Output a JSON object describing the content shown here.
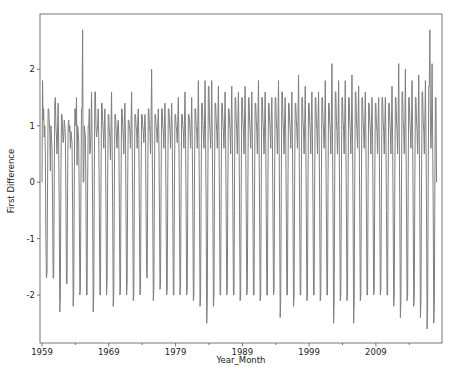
{
  "chart_data": {
    "type": "line",
    "title": "",
    "xlabel": "Year_Month",
    "ylabel": "First Difference",
    "x_tick_labels": [
      "1959",
      "1969",
      "1979",
      "1989",
      "1999",
      "2009"
    ],
    "y_tick_labels": [
      "-2",
      "-1",
      "0",
      "1",
      "2"
    ],
    "y_ticks": [
      -2,
      -1,
      0,
      1,
      2
    ],
    "xlim": [
      1958.7,
      2018.9
    ],
    "ylim": [
      -2.85,
      2.98
    ],
    "grid": false,
    "legend": null,
    "line_color": "#7f7f7f",
    "series": [
      {
        "name": "First Difference",
        "frequency": "monthly",
        "start": "1959-02",
        "years": [
          {
            "year": 1959,
            "values": [
              0.0,
              1.8,
              1.1,
              1.3,
              0.8,
              1.0,
              0.5,
              -1.0,
              -1.7,
              -1.6,
              0.0,
              1.3
            ]
          },
          {
            "year": 1960,
            "values": [
              1.3,
              1.1,
              0.9,
              0.2,
              1.0,
              0.8,
              0.6,
              -0.4,
              -1.7,
              -1.7,
              0.1,
              1.4
            ]
          },
          {
            "year": 1961,
            "values": [
              1.5,
              1.0,
              0.8,
              0.5,
              0.9,
              1.4,
              0.6,
              -0.5,
              -2.3,
              -2.0,
              0.1,
              1.2
            ]
          },
          {
            "year": 1962,
            "values": [
              1.2,
              0.9,
              0.7,
              0.8,
              1.1,
              1.0,
              0.8,
              -0.3,
              -1.8,
              -1.8,
              0.0,
              1.0
            ]
          },
          {
            "year": 1963,
            "values": [
              1.1,
              0.9,
              1.0,
              0.6,
              0.9,
              0.8,
              0.7,
              -0.5,
              -2.2,
              -2.0,
              0.0,
              1.3
            ]
          },
          {
            "year": 1964,
            "values": [
              1.3,
              1.0,
              1.5,
              0.3,
              1.0,
              0.9,
              0.7,
              -0.4,
              -2.0,
              -1.9,
              0.0,
              1.3
            ]
          },
          {
            "year": 1965,
            "values": [
              1.3,
              2.7,
              0.0,
              0.0,
              1.0,
              0.9,
              0.8,
              -0.3,
              -2.0,
              -2.0,
              0.0,
              1.0
            ]
          },
          {
            "year": 1966,
            "values": [
              1.0,
              1.3,
              0.5,
              0.6,
              0.9,
              1.6,
              0.8,
              -0.5,
              -2.3,
              -2.0,
              0.1,
              1.6
            ]
          },
          {
            "year": 1967,
            "values": [
              1.6,
              1.0,
              0.8,
              0.9,
              1.0,
              1.3,
              0.8,
              -0.4,
              -2.0,
              -2.0,
              0.0,
              1.4
            ]
          },
          {
            "year": 1968,
            "values": [
              1.4,
              1.1,
              0.9,
              0.6,
              1.0,
              1.3,
              0.7,
              -0.5,
              -2.0,
              -1.7,
              0.0,
              1.2
            ]
          },
          {
            "year": 1969,
            "values": [
              1.2,
              0.9,
              0.8,
              0.4,
              1.0,
              1.6,
              0.7,
              -0.5,
              -2.2,
              -2.0,
              0.0,
              1.2
            ]
          },
          {
            "year": 1970,
            "values": [
              1.2,
              1.0,
              0.7,
              0.6,
              1.0,
              1.1,
              0.8,
              -0.4,
              -2.0,
              -1.9,
              0.0,
              1.3
            ]
          },
          {
            "year": 1971,
            "values": [
              1.3,
              1.0,
              0.8,
              0.5,
              1.1,
              1.4,
              0.8,
              -0.5,
              -2.0,
              -1.8,
              0.0,
              1.1
            ]
          },
          {
            "year": 1972,
            "values": [
              1.1,
              1.0,
              0.9,
              0.6,
              1.0,
              1.6,
              0.8,
              -0.4,
              -2.1,
              -2.0,
              0.0,
              1.2
            ]
          },
          {
            "year": 1973,
            "values": [
              1.2,
              1.0,
              0.9,
              0.6,
              1.1,
              1.3,
              0.8,
              -0.5,
              -2.0,
              -1.9,
              0.0,
              1.2
            ]
          },
          {
            "year": 1974,
            "values": [
              1.2,
              1.0,
              0.9,
              0.7,
              1.0,
              1.2,
              0.9,
              -0.5,
              -1.6,
              -1.7,
              0.0,
              1.3
            ]
          },
          {
            "year": 1975,
            "values": [
              1.3,
              1.0,
              0.9,
              0.5,
              1.1,
              2.0,
              0.8,
              -0.5,
              -2.1,
              -1.9,
              0.0,
              1.2
            ]
          },
          {
            "year": 1976,
            "values": [
              1.2,
              1.0,
              0.9,
              0.7,
              1.0,
              1.3,
              0.8,
              -0.4,
              -1.9,
              -1.8,
              0.0,
              1.3
            ]
          },
          {
            "year": 1977,
            "values": [
              1.3,
              1.0,
              0.9,
              0.6,
              1.1,
              1.4,
              0.8,
              -0.5,
              -2.0,
              -1.9,
              0.0,
              1.3
            ]
          },
          {
            "year": 1978,
            "values": [
              1.3,
              1.1,
              0.9,
              0.6,
              1.0,
              1.4,
              0.9,
              -0.5,
              -2.0,
              -2.0,
              0.0,
              1.2
            ]
          },
          {
            "year": 1979,
            "values": [
              1.2,
              1.0,
              0.9,
              0.7,
              1.1,
              1.5,
              0.8,
              -0.5,
              -2.0,
              -1.8,
              0.0,
              1.2
            ]
          },
          {
            "year": 1980,
            "values": [
              1.2,
              1.0,
              0.9,
              0.6,
              1.1,
              1.6,
              0.8,
              -0.5,
              -2.0,
              -1.9,
              0.0,
              1.2
            ]
          },
          {
            "year": 1981,
            "values": [
              1.2,
              1.1,
              0.9,
              0.6,
              1.0,
              1.5,
              0.8,
              -0.4,
              -2.1,
              -2.0,
              0.0,
              1.3
            ]
          },
          {
            "year": 1982,
            "values": [
              1.3,
              1.0,
              0.9,
              0.6,
              1.1,
              1.8,
              0.8,
              -0.5,
              -2.2,
              -2.0,
              0.0,
              1.4
            ]
          },
          {
            "year": 1983,
            "values": [
              1.4,
              1.1,
              0.8,
              0.6,
              1.0,
              1.8,
              0.8,
              -0.5,
              -2.5,
              -2.1,
              0.0,
              1.7
            ]
          },
          {
            "year": 1984,
            "values": [
              1.7,
              1.1,
              0.9,
              0.6,
              1.0,
              1.8,
              0.8,
              -0.4,
              -2.2,
              -2.0,
              0.0,
              1.4
            ]
          },
          {
            "year": 1985,
            "values": [
              1.4,
              1.1,
              0.9,
              0.6,
              1.1,
              1.7,
              0.8,
              -0.5,
              -2.0,
              -2.0,
              0.0,
              1.4
            ]
          },
          {
            "year": 1986,
            "values": [
              1.4,
              1.1,
              0.9,
              0.6,
              1.0,
              1.6,
              0.8,
              -0.5,
              -2.0,
              -1.9,
              0.0,
              1.3
            ]
          },
          {
            "year": 1987,
            "values": [
              1.3,
              1.1,
              0.9,
              0.5,
              1.1,
              1.7,
              0.8,
              -0.5,
              -2.0,
              -2.0,
              0.0,
              1.5
            ]
          },
          {
            "year": 1988,
            "values": [
              1.5,
              1.1,
              0.9,
              0.5,
              1.1,
              1.6,
              0.8,
              -0.5,
              -2.1,
              -2.0,
              0.0,
              1.5
            ]
          },
          {
            "year": 1989,
            "values": [
              1.5,
              1.1,
              0.9,
              0.5,
              1.1,
              1.7,
              0.8,
              -0.5,
              -2.0,
              -1.9,
              0.0,
              1.5
            ]
          },
          {
            "year": 1990,
            "values": [
              1.5,
              1.1,
              0.9,
              0.6,
              1.0,
              1.6,
              0.8,
              -0.5,
              -2.0,
              -2.0,
              0.0,
              1.4
            ]
          },
          {
            "year": 1991,
            "values": [
              1.4,
              1.1,
              0.9,
              0.5,
              1.1,
              1.8,
              0.8,
              -0.5,
              -2.1,
              -2.0,
              0.0,
              1.5
            ]
          },
          {
            "year": 1992,
            "values": [
              1.5,
              1.1,
              0.9,
              0.5,
              1.0,
              1.6,
              0.8,
              -0.5,
              -2.0,
              -2.0,
              0.0,
              1.4
            ]
          },
          {
            "year": 1993,
            "values": [
              1.4,
              1.1,
              0.9,
              0.6,
              1.1,
              1.5,
              0.8,
              -0.5,
              -2.0,
              -1.9,
              0.0,
              1.5
            ]
          },
          {
            "year": 1994,
            "values": [
              1.5,
              1.1,
              0.9,
              0.5,
              1.0,
              1.8,
              0.8,
              -0.5,
              -2.4,
              -2.1,
              0.0,
              1.6
            ]
          },
          {
            "year": 1995,
            "values": [
              1.6,
              1.1,
              0.9,
              0.5,
              1.1,
              1.5,
              0.8,
              -0.5,
              -2.0,
              -2.0,
              0.0,
              1.4
            ]
          },
          {
            "year": 1996,
            "values": [
              1.4,
              1.1,
              0.9,
              0.6,
              1.0,
              1.6,
              0.8,
              -0.5,
              -2.2,
              -2.0,
              0.0,
              1.4
            ]
          },
          {
            "year": 1997,
            "values": [
              1.4,
              1.1,
              0.9,
              0.6,
              1.1,
              1.9,
              0.8,
              -0.5,
              -2.0,
              -2.0,
              0.0,
              1.5
            ]
          },
          {
            "year": 1998,
            "values": [
              1.5,
              1.1,
              0.9,
              0.5,
              1.0,
              1.7,
              0.8,
              -0.5,
              -2.1,
              -2.0,
              0.0,
              1.4
            ]
          },
          {
            "year": 1999,
            "values": [
              1.4,
              1.1,
              0.9,
              0.5,
              1.1,
              1.6,
              0.8,
              -0.5,
              -2.0,
              -2.0,
              0.0,
              1.5
            ]
          },
          {
            "year": 2000,
            "values": [
              1.5,
              1.1,
              0.9,
              0.5,
              1.1,
              1.6,
              0.8,
              -0.5,
              -2.1,
              -2.0,
              0.0,
              1.5
            ]
          },
          {
            "year": 2001,
            "values": [
              1.5,
              1.1,
              0.9,
              0.6,
              1.0,
              1.8,
              0.8,
              -0.5,
              -2.0,
              -2.0,
              0.0,
              1.4
            ]
          },
          {
            "year": 2002,
            "values": [
              1.4,
              1.1,
              0.9,
              0.5,
              1.1,
              2.1,
              0.8,
              -0.5,
              -2.5,
              -2.1,
              0.0,
              1.6
            ]
          },
          {
            "year": 2003,
            "values": [
              1.6,
              1.1,
              0.9,
              0.5,
              1.0,
              1.8,
              0.8,
              -0.5,
              -2.1,
              -2.0,
              0.0,
              1.5
            ]
          },
          {
            "year": 2004,
            "values": [
              1.5,
              1.1,
              0.9,
              0.5,
              1.1,
              1.8,
              0.8,
              -0.5,
              -2.1,
              -2.0,
              0.0,
              1.5
            ]
          },
          {
            "year": 2005,
            "values": [
              1.5,
              1.1,
              0.9,
              0.5,
              1.0,
              1.9,
              0.8,
              -0.5,
              -2.5,
              -2.1,
              0.0,
              1.6
            ]
          },
          {
            "year": 2006,
            "values": [
              1.6,
              1.1,
              0.9,
              0.6,
              1.1,
              1.7,
              0.8,
              -0.5,
              -2.1,
              -2.0,
              0.0,
              1.5
            ]
          },
          {
            "year": 2007,
            "values": [
              1.5,
              1.1,
              0.9,
              0.6,
              1.0,
              1.6,
              0.8,
              -0.5,
              -2.0,
              -2.0,
              0.0,
              1.4
            ]
          },
          {
            "year": 2008,
            "values": [
              1.4,
              1.1,
              0.9,
              0.5,
              1.1,
              1.5,
              0.8,
              -0.5,
              -2.0,
              -1.9,
              0.0,
              1.4
            ]
          },
          {
            "year": 2009,
            "values": [
              1.4,
              1.0,
              0.9,
              0.5,
              1.1,
              1.5,
              0.8,
              -0.5,
              -2.0,
              -1.9,
              0.0,
              1.5
            ]
          },
          {
            "year": 2010,
            "values": [
              1.5,
              1.1,
              0.9,
              0.5,
              1.0,
              1.5,
              0.8,
              -0.5,
              -2.0,
              -2.0,
              0.0,
              1.4
            ]
          },
          {
            "year": 2011,
            "values": [
              1.4,
              1.1,
              0.9,
              0.5,
              1.1,
              1.7,
              0.8,
              -0.5,
              -2.2,
              -2.0,
              0.0,
              1.5
            ]
          },
          {
            "year": 2012,
            "values": [
              1.5,
              1.1,
              0.9,
              0.5,
              1.1,
              2.1,
              0.8,
              -0.5,
              -2.4,
              -2.1,
              0.0,
              1.6
            ]
          },
          {
            "year": 2013,
            "values": [
              1.6,
              1.1,
              0.9,
              0.5,
              1.0,
              2.0,
              0.8,
              -0.5,
              -2.1,
              -2.0,
              0.0,
              1.5
            ]
          },
          {
            "year": 2014,
            "values": [
              1.5,
              1.1,
              0.9,
              0.6,
              1.1,
              1.8,
              0.8,
              -0.5,
              -2.2,
              -2.0,
              0.0,
              1.5
            ]
          },
          {
            "year": 2015,
            "values": [
              1.5,
              1.1,
              0.9,
              0.5,
              1.0,
              1.9,
              0.8,
              -0.5,
              -2.4,
              -2.1,
              0.0,
              1.6
            ]
          },
          {
            "year": 2016,
            "values": [
              1.6,
              1.1,
              0.9,
              0.5,
              1.1,
              1.8,
              0.8,
              -0.5,
              -2.6,
              -2.2,
              0.0,
              1.7
            ]
          },
          {
            "year": 2017,
            "values": [
              1.7,
              2.7,
              1.0,
              0.6,
              1.1,
              2.1,
              0.8,
              -0.5,
              -2.5,
              -2.2,
              0.0,
              1.5
            ]
          },
          {
            "year": 2018,
            "values": [
              1.5,
              0.0,
              0.0
            ]
          }
        ]
      }
    ]
  }
}
